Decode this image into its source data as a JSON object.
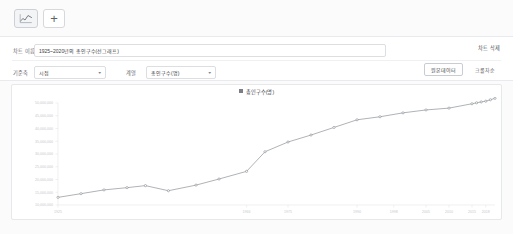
{
  "toolbar": {
    "chart_tab_icon": "line-chart-icon",
    "chart_tab_title": "차트",
    "add_label": "+",
    "add_title": "추가"
  },
  "form": {
    "title_label": "차트 이름",
    "title_value": "1925~2020년의 총인구수(선그래프)",
    "title_placeholder": "차트 이름",
    "axis_label": "기준축",
    "axis_value": "시점",
    "series_label": "계열",
    "series_value": "총인구수(명)",
    "delete_label": "차트 삭제",
    "source_button": "원본데이터",
    "fullscreen_button": "크롤차순"
  },
  "chart_card": {
    "legend_marker": "legend-swatch",
    "legend_label": "총인구수(명)"
  },
  "chart_data": {
    "type": "line",
    "title": "총인구수(명)",
    "xlabel": "",
    "ylabel": "",
    "grid": false,
    "legend_position": "top-center",
    "series": [
      {
        "name": "총인구수(명)",
        "x": [
          1925,
          1930,
          1935,
          1940,
          1944,
          1949,
          1955,
          1960,
          1966,
          1970,
          1975,
          1980,
          1985,
          1990,
          1995,
          2000,
          2005,
          2010,
          2015,
          2016,
          2017,
          2018,
          2019,
          2020
        ],
        "values": [
          12997611,
          14441531,
          15920000,
          16800000,
          17600000,
          15600000,
          17800000,
          20188641,
          23200000,
          30882386,
          34706620,
          37436315,
          40419652,
          43410899,
          44608726,
          46136101,
          47278951,
          47990761,
          49705663,
          50083800,
          50423955,
          50704971,
          51269000,
          51836239
        ]
      }
    ],
    "ylim": [
      10000000,
      55000000,
      "note: axis tick labels shown on plot"
    ],
    "yticks": [
      10000000,
      15000000,
      20000000,
      25000000,
      30000000,
      35000000,
      40000000,
      45000000,
      50000000
    ],
    "ytick_labels": [
      "10,000,000",
      "15,000,000",
      "20,000,000",
      "25,000,000",
      "30,000,000",
      "35,000,000",
      "40,000,000",
      "45,000,000",
      "50,000,000"
    ],
    "xticks": [
      1925,
      1966,
      1975,
      1990,
      1998,
      2005,
      2010,
      2015,
      2018
    ],
    "xtick_labels": [
      "1925",
      "1966",
      "1975",
      "1990",
      "1998",
      "2005",
      "2010",
      "2015",
      "2018"
    ]
  },
  "colors": {
    "line": "#8d9298",
    "marker": "#7c8187",
    "panel_bg": "#ffffff",
    "page_bg": "#fbfbfc",
    "border": "#e6e8ea",
    "text": "#3c4043",
    "muted_text": "#c7cace"
  }
}
